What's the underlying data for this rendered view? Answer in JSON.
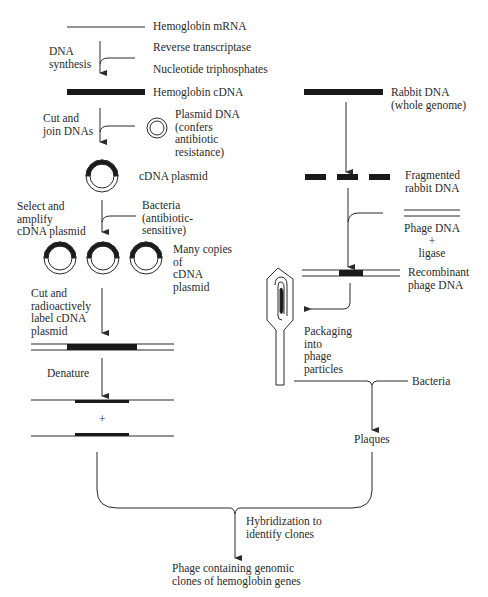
{
  "left_pathway": {
    "mrna_label": "Hemoglobin mRNA",
    "step1_label": "DNA\nsynthesis",
    "reagent1": "Reverse transcriptase",
    "reagent2": "Nucleotide triphosphates",
    "cdna_label": "Hemoglobin cDNA",
    "step2_label": "Cut and\njoin DNAs",
    "plasmid_label": "Plasmid DNA\n(confers\nantibiotic\nresistance)",
    "cdna_plasmid_label": "cDNA plasmid",
    "step3_label": "Select and\namplify\ncDNA plasmid",
    "bacteria_label": "Bacteria\n(antibiotic-\nsensitive)",
    "copies_label": "Many copies\nof\ncDNA\nplasmid",
    "step4_label": "Cut and\nradioactively\nlabel cDNA\nplasmid",
    "step5_label": "Denature",
    "plus": "+"
  },
  "right_pathway": {
    "rabbit_dna_label": "Rabbit DNA\n(whole genome)",
    "fragmented_label": "Fragmented\nrabbit DNA",
    "phage_dna_label": "Phage DNA\n+\nligase",
    "recombinant_label": "Recombinant\nphage DNA",
    "packaging_label": "Packaging\ninto\nphage\nparticles",
    "bacteria_label": "Bacteria",
    "plaques_label": "Plaques"
  },
  "merge": {
    "hybridization_label": "Hybridization to\nidentify clones",
    "result_label": "Phage containing genomic\nclones of hemoglobin genes"
  },
  "colors": {
    "ink": "#2a2a2a",
    "background": "#ffffff"
  }
}
